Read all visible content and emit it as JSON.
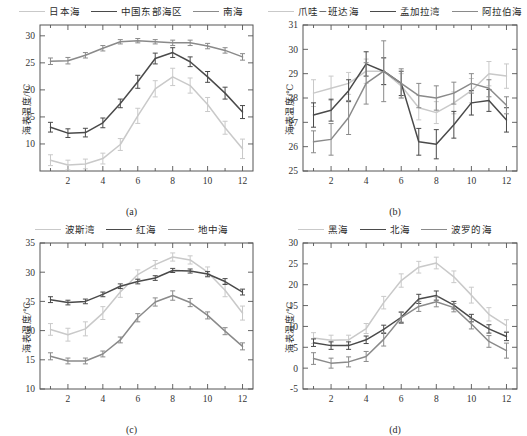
{
  "figure": {
    "ylabel": "海表温度/℃",
    "xticks": [
      2,
      4,
      6,
      8,
      10,
      12
    ],
    "months": [
      1,
      2,
      3,
      4,
      5,
      6,
      7,
      8,
      9,
      10,
      11,
      12
    ],
    "colors": {
      "light": "#c9c9c9",
      "dark": "#4a4a4a",
      "mid": "#8a8a8a"
    }
  },
  "chart_data": [
    {
      "type": "line",
      "panel": "(a)",
      "title": "",
      "xlabel": "",
      "ylabel": "海表温度/℃",
      "xlim": [
        0.4,
        12.6
      ],
      "ylim": [
        5,
        32
      ],
      "yticks": [
        10,
        15,
        20,
        25,
        30
      ],
      "xticks": [
        2,
        4,
        6,
        8,
        10,
        12
      ],
      "x": [
        1,
        2,
        3,
        4,
        5,
        6,
        7,
        8,
        9,
        10,
        11,
        12
      ],
      "grid": false,
      "legend_position": "top",
      "series": [
        {
          "name": "日本海",
          "color": "#c9c9c9",
          "values": [
            7.0,
            6.1,
            6.3,
            7.3,
            9.9,
            15.2,
            20.2,
            22.4,
            20.8,
            17.3,
            13.0,
            9.1
          ],
          "err": [
            1.0,
            0.9,
            0.9,
            1.0,
            1.1,
            1.4,
            1.5,
            1.6,
            1.4,
            1.3,
            1.2,
            1.8
          ]
        },
        {
          "name": "中国东部海区",
          "color": "#4a4a4a",
          "values": [
            13.1,
            12.0,
            12.1,
            13.9,
            17.5,
            21.5,
            25.8,
            26.9,
            25.2,
            22.4,
            19.4,
            15.9
          ],
          "err": [
            0.9,
            0.8,
            0.8,
            0.9,
            0.8,
            1.2,
            1.0,
            0.9,
            0.9,
            1.0,
            1.1,
            1.2
          ]
        },
        {
          "name": "南海",
          "color": "#8a8a8a",
          "values": [
            25.3,
            25.4,
            26.4,
            27.7,
            28.9,
            29.1,
            28.9,
            28.7,
            28.7,
            28.1,
            27.3,
            26.1
          ],
          "err": [
            0.6,
            0.6,
            0.5,
            0.5,
            0.4,
            0.4,
            0.4,
            0.5,
            0.5,
            0.5,
            0.5,
            0.6
          ]
        }
      ]
    },
    {
      "type": "line",
      "panel": "(b)",
      "title": "",
      "xlabel": "",
      "ylabel": "海表温度/℃",
      "xlim": [
        0.4,
        12.6
      ],
      "ylim": [
        25,
        31
      ],
      "yticks": [
        25,
        26,
        27,
        28,
        29,
        30,
        31
      ],
      "xticks": [
        2,
        4,
        6,
        8,
        10,
        12
      ],
      "x": [
        1,
        2,
        3,
        4,
        5,
        6,
        7,
        8,
        9,
        10,
        11,
        12
      ],
      "grid": false,
      "legend_position": "top",
      "series": [
        {
          "name": "爪哇－班达海",
          "color": "#c9c9c9",
          "values": [
            28.2,
            28.4,
            28.6,
            29.1,
            29.1,
            28.5,
            27.6,
            27.4,
            27.8,
            28.3,
            29.0,
            28.9
          ],
          "err": [
            0.55,
            0.5,
            0.45,
            0.5,
            0.55,
            0.5,
            0.5,
            0.45,
            0.45,
            0.5,
            0.5,
            0.5
          ]
        },
        {
          "name": "孟加拉湾",
          "color": "#4a4a4a",
          "values": [
            27.3,
            27.5,
            28.3,
            29.4,
            29.1,
            28.6,
            26.2,
            26.1,
            26.9,
            27.8,
            27.9,
            27.1
          ],
          "err": [
            0.5,
            0.45,
            0.45,
            0.5,
            0.55,
            0.5,
            0.55,
            0.6,
            0.55,
            0.5,
            0.45,
            0.5
          ]
        },
        {
          "name": "阿拉伯海",
          "color": "#8a8a8a",
          "values": [
            26.2,
            26.3,
            27.2,
            28.6,
            29.1,
            28.6,
            28.1,
            28.0,
            28.2,
            28.6,
            28.4,
            27.7
          ],
          "err": [
            0.45,
            0.65,
            0.7,
            0.85,
            1.25,
            0.6,
            0.5,
            0.5,
            0.45,
            0.4,
            0.35,
            0.35
          ]
        }
      ]
    },
    {
      "type": "line",
      "panel": "(c)",
      "title": "",
      "xlabel": "",
      "ylabel": "海表温度/℃",
      "xlim": [
        0.4,
        12.6
      ],
      "ylim": [
        10,
        35
      ],
      "yticks": [
        10,
        15,
        20,
        25,
        30,
        35
      ],
      "xticks": [
        2,
        4,
        6,
        8,
        10,
        12
      ],
      "x": [
        1,
        2,
        3,
        4,
        5,
        6,
        7,
        8,
        9,
        10,
        11,
        12
      ],
      "grid": false,
      "legend_position": "top",
      "series": [
        {
          "name": "波斯湾",
          "color": "#c9c9c9",
          "values": [
            20.2,
            19.3,
            20.3,
            23.0,
            26.6,
            29.6,
            31.3,
            32.6,
            32.1,
            30.0,
            26.9,
            23.0
          ],
          "err": [
            1.0,
            1.1,
            1.2,
            1.1,
            0.9,
            0.8,
            0.7,
            0.7,
            0.7,
            0.9,
            1.1,
            1.2
          ]
        },
        {
          "name": "红海",
          "color": "#4a4a4a",
          "values": [
            25.3,
            24.8,
            25.0,
            26.2,
            27.6,
            28.4,
            29.0,
            30.3,
            30.2,
            29.7,
            28.4,
            26.6
          ],
          "err": [
            0.5,
            0.4,
            0.4,
            0.4,
            0.4,
            0.4,
            0.4,
            0.35,
            0.35,
            0.4,
            0.5,
            0.5
          ]
        },
        {
          "name": "地中海",
          "color": "#8a8a8a",
          "values": [
            15.6,
            14.8,
            14.8,
            16.0,
            18.4,
            22.2,
            24.9,
            26.0,
            24.8,
            22.6,
            19.9,
            17.3
          ],
          "err": [
            0.6,
            0.5,
            0.5,
            0.5,
            0.5,
            0.7,
            0.7,
            0.8,
            0.7,
            0.6,
            0.6,
            0.6
          ]
        }
      ]
    },
    {
      "type": "line",
      "panel": "(d)",
      "title": "",
      "xlabel": "",
      "ylabel": "海表温度/℃",
      "xlim": [
        0.4,
        12.6
      ],
      "ylim": [
        -5,
        30
      ],
      "yticks": [
        -5,
        0,
        5,
        10,
        15,
        20,
        25,
        30
      ],
      "xticks": [
        2,
        4,
        6,
        8,
        10,
        12
      ],
      "x": [
        1,
        2,
        3,
        4,
        5,
        6,
        7,
        8,
        9,
        10,
        11,
        12
      ],
      "grid": false,
      "legend_position": "top",
      "series": [
        {
          "name": "黑海",
          "color": "#c9c9c9",
          "values": [
            7.2,
            6.7,
            6.8,
            9.5,
            15.7,
            21.0,
            24.2,
            25.2,
            21.9,
            17.5,
            12.9,
            10.2
          ],
          "err": [
            1.3,
            1.2,
            1.1,
            1.2,
            1.5,
            1.6,
            1.4,
            1.4,
            1.4,
            1.9,
            1.6,
            1.4
          ]
        },
        {
          "name": "北海",
          "color": "#4a4a4a",
          "values": [
            6.1,
            5.4,
            5.4,
            6.8,
            9.3,
            12.2,
            16.6,
            17.4,
            15.1,
            12.0,
            9.4,
            7.6
          ],
          "err": [
            0.9,
            0.9,
            0.9,
            0.9,
            1.0,
            1.2,
            1.1,
            1.1,
            0.9,
            0.9,
            1.0,
            1.0
          ]
        },
        {
          "name": "波罗的海",
          "color": "#8a8a8a",
          "values": [
            2.3,
            1.2,
            1.5,
            2.8,
            6.9,
            12.1,
            14.8,
            15.9,
            14.5,
            10.6,
            6.4,
            4.2
          ],
          "err": [
            1.4,
            1.2,
            1.2,
            1.2,
            1.6,
            1.4,
            1.2,
            1.2,
            1.0,
            1.2,
            1.4,
            1.8
          ]
        }
      ]
    }
  ]
}
